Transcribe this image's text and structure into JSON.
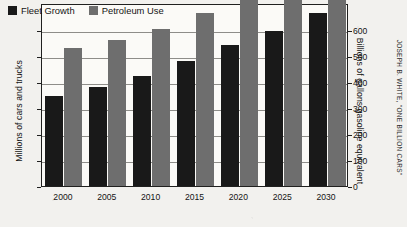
{
  "chart_data": {
    "type": "bar",
    "title": "",
    "subtitle": "",
    "categories": [
      "2000",
      "2005",
      "2010",
      "2015",
      "2020",
      "2025",
      "2030"
    ],
    "series": [
      {
        "name": "Fleet Growth",
        "axis": "left",
        "color": "#191919",
        "values": [
          690,
          760,
          850,
          965,
          1085,
          1195,
          1330
        ]
      },
      {
        "name": "Petroleum Use",
        "axis": "right",
        "color": "#6e6e6e",
        "values": [
          530,
          560,
          605,
          665,
          740,
          775,
          825
        ]
      }
    ],
    "xlabel": "",
    "ylabel": "Millions of cars and trucks",
    "ylabel_right": "Billions of gallons gasoline equivalent",
    "ylim": [
      0,
      1408
    ],
    "ylim_right": [
      0,
      704
    ],
    "yticks": [
      0,
      200,
      400,
      600,
      800,
      1000,
      1200
    ],
    "yticks_right": [
      0,
      100,
      200,
      300,
      400,
      500,
      600
    ],
    "ytick_labels": [
      "0",
      "200",
      "400",
      "600",
      "800",
      "1000",
      "1200"
    ],
    "ytick_labels_right": [
      "0",
      "100",
      "200",
      "300",
      "400",
      "500",
      "600"
    ],
    "grid": "horizontal",
    "legend_position": "top-left-inside",
    "annotations": [
      "JOSEPH B. WHITE, \"ONE BILLION CARS\""
    ]
  },
  "legend": {
    "items": [
      {
        "label": "Fleet Growth",
        "color": "#191919"
      },
      {
        "label": "Petroleum Use",
        "color": "#6e6e6e"
      }
    ]
  },
  "axes": {
    "left_title": "Millions of cars and trucks",
    "right_title": "Billions of gallons gasoline equivalent"
  },
  "credit": {
    "text": "JOSEPH B. WHITE, \"ONE BILLION CARS\""
  },
  "colors": {
    "fleet": "#191919",
    "petroleum": "#6e6e6e",
    "frame": "#20201f",
    "grid": "#8e8d89",
    "background": "#f2f1ee",
    "plot_background": "#fbfaf7"
  }
}
